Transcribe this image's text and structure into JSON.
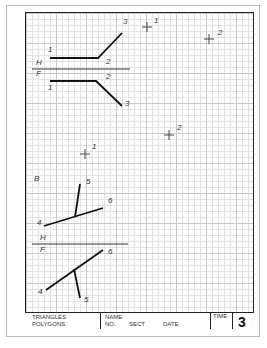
{
  "sheet": {
    "view_labels": {
      "top_h": "H",
      "top_f": "F",
      "aux": "B",
      "bottom_h": "H",
      "bottom_f": "F"
    },
    "upper_problem": {
      "horizontal_view_points": [
        "1",
        "2",
        "3"
      ],
      "front_view_points": [
        "1",
        "2",
        "3"
      ],
      "marks": [
        {
          "label": "1"
        },
        {
          "label": "2"
        },
        {
          "label": "2"
        },
        {
          "label": "1"
        }
      ]
    },
    "lower_problem": {
      "horizontal_view_points": [
        "4",
        "5",
        "6"
      ],
      "front_view_points": [
        "4",
        "5",
        "6"
      ]
    }
  },
  "title_block": {
    "subject_line1": "TRIANGLES",
    "subject_line2": "POLYGONS",
    "name_label": "NAME",
    "no_label": "NO.",
    "sect_label": "SECT",
    "date_label": "DATE",
    "time_label": "TIME",
    "sheet_number": "3"
  }
}
